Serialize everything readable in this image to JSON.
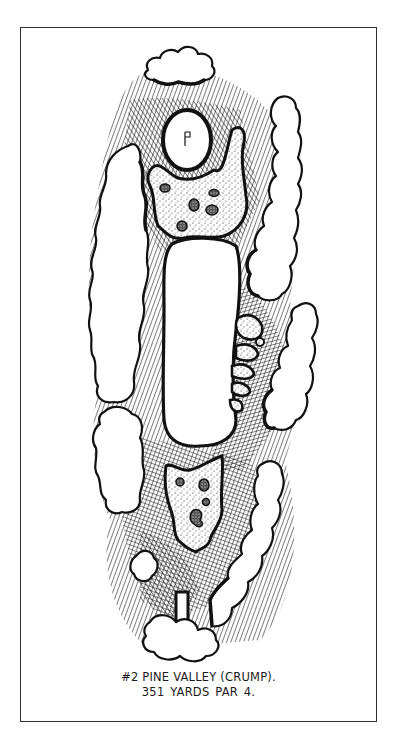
{
  "figure": {
    "title_line": "#2 PINE VALLEY (CRUMP).",
    "yardage_line": "351 YARDS   PAR 4.",
    "hole_number": "#2",
    "course": "PINE VALLEY",
    "architect": "CRUMP",
    "yards": "351",
    "par": "4",
    "flag_glyph": "P"
  },
  "elements": {
    "green": "putting-green",
    "fairway": "fairway",
    "tee": "tee-box",
    "bunkers": [
      "greenside-bunker-complex",
      "right-fairway-bunkers",
      "front-waste-bunker"
    ],
    "trees": [
      "top-trees",
      "left-trees-upper",
      "left-trees-lower",
      "right-trees-upper",
      "right-trees-mid",
      "right-trees-lower",
      "tee-trees",
      "small-tree-left"
    ]
  },
  "colors": {
    "ink": "#111111",
    "paper": "#ffffff",
    "frame": "#333333"
  }
}
